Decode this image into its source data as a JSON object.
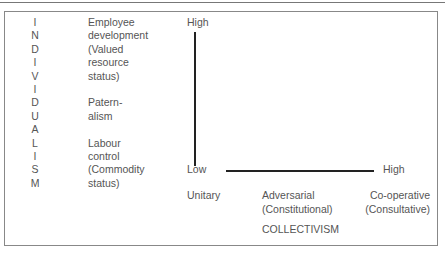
{
  "left_axis": {
    "letters": [
      "I",
      "N",
      "D",
      "I",
      "V",
      "I",
      "D",
      "U",
      "A",
      "L",
      "I",
      "S",
      "M"
    ],
    "word": "INDIVIDUALISM"
  },
  "individualism_levels": [
    {
      "lines": [
        "Employee",
        "development",
        "(Valued",
        "resource",
        "status)"
      ]
    },
    {
      "lines": [
        "Patern-",
        "alism"
      ]
    },
    {
      "lines": [
        "Labour",
        "control",
        "(Commodity",
        "status)"
      ]
    }
  ],
  "text_column": [
    "Employee",
    "development",
    "(Valued",
    "resource",
    "status)",
    "",
    "Patern-",
    "alism",
    "",
    "Labour",
    "control",
    "(Commodity",
    "status)"
  ],
  "vertical_axis": {
    "high_label": "High",
    "low_label": "Low"
  },
  "horizontal_axis": {
    "high_label": "High"
  },
  "collectivism_levels": [
    {
      "line1": "Unitary",
      "line2": ""
    },
    {
      "line1": "Adversarial",
      "line2": "(Constitutional)"
    },
    {
      "line1": "Co-operative",
      "line2": "(Consultative)"
    }
  ],
  "bottom_axis_title": "COLLECTIVISM"
}
